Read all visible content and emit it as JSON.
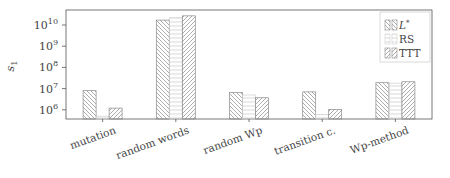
{
  "chart_data": {
    "type": "bar",
    "title": "",
    "xlabel": "",
    "ylabel": "s1",
    "ylabel_main": "s",
    "ylabel_sub": "1",
    "yscale": "log",
    "ylim": [
      400000,
      60000000000
    ],
    "yticks": [
      {
        "exp": 6,
        "value": 1000000
      },
      {
        "exp": 7,
        "value": 10000000
      },
      {
        "exp": 8,
        "value": 100000000
      },
      {
        "exp": 9,
        "value": 1000000000
      },
      {
        "exp": 10,
        "value": 10000000000
      }
    ],
    "categories": [
      "mutation",
      "random words",
      "random Wp",
      "transition c.",
      "Wp-method"
    ],
    "series": [
      {
        "name": "L*",
        "pattern": "diag-back",
        "values": [
          8000000,
          17000000000,
          6500000,
          7000000,
          19000000
        ]
      },
      {
        "name": "RS",
        "pattern": "horizontal",
        "values": [
          500000,
          22000000000,
          5000000,
          600000,
          18000000
        ]
      },
      {
        "name": "TTT",
        "pattern": "diag-fwd",
        "values": [
          1200000,
          27000000000,
          3700000,
          1050000,
          21000000
        ]
      }
    ],
    "legend": {
      "position": "upper right",
      "entries": [
        "L*",
        "RS",
        "TTT"
      ]
    },
    "grid": false
  },
  "colors": {
    "axis": "#555555",
    "hatch": "#8a8a8a",
    "legend_border": "#d0d0d0"
  }
}
